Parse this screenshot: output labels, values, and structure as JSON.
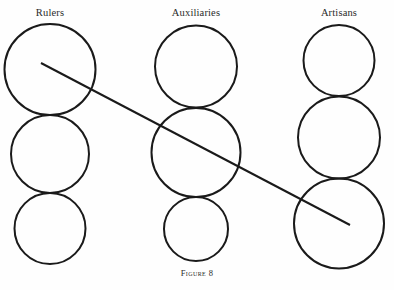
{
  "figure": {
    "caption": "Figure 8",
    "width": 394,
    "height": 290,
    "background_color": "#fefefe",
    "stroke_color": "#1a1a1a"
  },
  "columns": [
    {
      "id": "rulers",
      "label": "Rulers",
      "label_x": 50,
      "label_y": 13,
      "circles": [
        {
          "cx": 50,
          "cy": 69.5,
          "r": 45.5,
          "stroke_width": 2.0
        },
        {
          "cx": 50,
          "cy": 154.0,
          "r": 39.0,
          "stroke_width": 2.0
        },
        {
          "cx": 50,
          "cy": 228.5,
          "r": 35.5,
          "stroke_width": 2.0
        }
      ]
    },
    {
      "id": "auxiliaries",
      "label": "Auxiliaries",
      "label_x": 196,
      "label_y": 13,
      "circles": [
        {
          "cx": 196,
          "cy": 66.5,
          "r": 41.0,
          "stroke_width": 2.0
        },
        {
          "cx": 196,
          "cy": 152.5,
          "r": 44.5,
          "stroke_width": 2.0
        },
        {
          "cx": 196,
          "cy": 229.0,
          "r": 32.0,
          "stroke_width": 2.0
        }
      ]
    },
    {
      "id": "artisans",
      "label": "Artisans",
      "label_x": 339,
      "label_y": 13,
      "circles": [
        {
          "cx": 339,
          "cy": 60.5,
          "r": 35.5,
          "stroke_width": 2.0
        },
        {
          "cx": 339,
          "cy": 137.5,
          "r": 41.0,
          "stroke_width": 2.0
        },
        {
          "cx": 339,
          "cy": 223.5,
          "r": 45.0,
          "stroke_width": 2.0
        }
      ]
    }
  ],
  "diagonal_line": {
    "x1": 41,
    "y1": 63,
    "x2": 350,
    "y2": 225,
    "stroke_width": 2.0
  }
}
